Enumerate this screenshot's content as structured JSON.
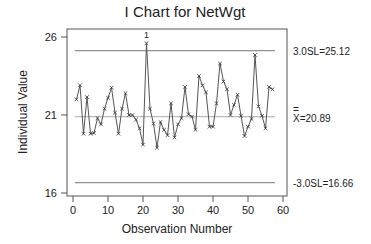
{
  "chart_data": {
    "type": "line",
    "title": "I Chart for NetWgt",
    "xlabel": "Observation Number",
    "ylabel": "Individual Value",
    "xlim": [
      0,
      60
    ],
    "ylim": [
      16,
      26
    ],
    "x_ticks": [
      0,
      10,
      20,
      30,
      40,
      50,
      60
    ],
    "y_ticks": [
      16,
      21,
      26
    ],
    "grid": false,
    "legend": null,
    "reference_lines": [
      {
        "name": "UCL",
        "value": 25.12,
        "label": "3.0SL=25.12"
      },
      {
        "name": "Center",
        "value": 20.89,
        "label_bar": "=",
        "label": "X=20.89"
      },
      {
        "name": "LCL",
        "value": 16.66,
        "label": "-3.0SL=16.66"
      }
    ],
    "annotations": [
      {
        "x": 21,
        "text": "1",
        "note": "point beyond 3.0SL test 1 failure"
      }
    ],
    "x": [
      1,
      2,
      3,
      4,
      5,
      6,
      7,
      8,
      9,
      10,
      11,
      12,
      13,
      14,
      15,
      16,
      17,
      18,
      19,
      20,
      21,
      22,
      23,
      24,
      25,
      26,
      27,
      28,
      29,
      30,
      31,
      32,
      33,
      34,
      35,
      36,
      37,
      38,
      39,
      40,
      41,
      42,
      43,
      44,
      45,
      46,
      47,
      48,
      49,
      50,
      51,
      52,
      53,
      54,
      55,
      56,
      57
    ],
    "series": [
      {
        "name": "NetWgt",
        "values": [
          22.0,
          22.9,
          19.8,
          22.15,
          19.8,
          19.85,
          20.8,
          20.4,
          21.4,
          22.1,
          22.75,
          21.15,
          19.8,
          21.4,
          22.4,
          21.0,
          21.0,
          20.7,
          20.15,
          19.1,
          25.6,
          21.4,
          20.45,
          18.9,
          20.55,
          20.05,
          19.7,
          21.75,
          19.55,
          20.4,
          20.8,
          22.8,
          21.05,
          20.9,
          20.05,
          23.5,
          22.9,
          22.45,
          20.25,
          20.25,
          21.75,
          24.3,
          23.15,
          22.65,
          21.0,
          21.65,
          22.3,
          20.95,
          19.65,
          20.25,
          20.75,
          24.85,
          21.55,
          20.95,
          20.15,
          22.8,
          22.65
        ]
      }
    ]
  },
  "colors": {
    "line": "#555555",
    "frame": "#555555",
    "control_lines": "#888888",
    "text": "#222222"
  }
}
